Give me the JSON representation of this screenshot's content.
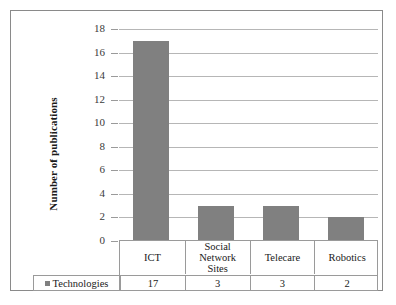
{
  "chart_data": {
    "type": "bar",
    "title": "",
    "xlabel": "",
    "ylabel": "Number of publications",
    "categories": [
      "ICT",
      "Social Network Sites",
      "Telecare",
      "Robotics"
    ],
    "category_lines": [
      [
        "ICT"
      ],
      [
        "Social",
        "Network",
        "Sites"
      ],
      [
        "Telecare"
      ],
      [
        "Robotics"
      ]
    ],
    "values": [
      17,
      3,
      3,
      2
    ],
    "series": [
      {
        "name": "Technologies",
        "values": [
          17,
          3,
          3,
          2
        ],
        "color": "#808080"
      }
    ],
    "ylim": [
      0,
      18
    ],
    "ytick_step": 2,
    "yticks": [
      18,
      16,
      14,
      12,
      10,
      8,
      6,
      4,
      2,
      0
    ],
    "grid": true,
    "legend_position": "table-left",
    "data_table": {
      "row_label": "Technologies",
      "row_values": [
        "17",
        "3",
        "3",
        "2"
      ]
    }
  },
  "colors": {
    "bar": "#808080",
    "gridline": "#b6b6b6",
    "border": "#8a8a8a",
    "table_border": "#9a9a9a",
    "text": "#1a1a1a",
    "background": "#ffffff"
  },
  "icons": {
    "legend_marker": "legend-swatch-icon"
  }
}
